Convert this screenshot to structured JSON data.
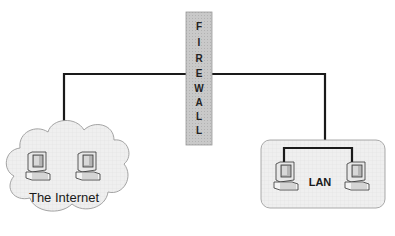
{
  "diagram": {
    "type": "network-topology",
    "firewall": {
      "label": "FIREWALL",
      "letters": [
        "F",
        "I",
        "R",
        "E",
        "W",
        "A",
        "L",
        "L"
      ],
      "fill": "#c8c8c8"
    },
    "internet": {
      "label": "The Internet",
      "shape": "cloud",
      "computers": 2,
      "fill": "#eeeeee"
    },
    "lan": {
      "label": "LAN",
      "shape": "rounded-rectangle",
      "computers": 2,
      "fill": "#f0f0f0"
    },
    "connections": [
      {
        "from": "internet",
        "to": "firewall"
      },
      {
        "from": "firewall",
        "to": "lan"
      }
    ],
    "line_color": "#1a1a1a"
  }
}
